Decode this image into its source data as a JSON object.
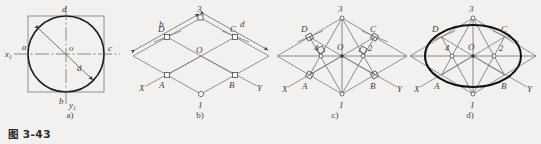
{
  "figure": {
    "caption": "图 3-43",
    "panels": [
      {
        "id": "a",
        "sub_label": "a)",
        "description": "circle inscribed in square with axes x1 y1 and diameter d",
        "labels": {
          "axis_x": "x",
          "axis_x_sub": "1",
          "axis_y": "y",
          "axis_y_sub": "1",
          "point_left": "a",
          "point_right": "c",
          "point_top": "d",
          "point_bottom": "b",
          "center": "o",
          "diameter": "d"
        }
      },
      {
        "id": "b",
        "sub_label": "b)",
        "description": "isometric rhombus projection of square with axes X Y and dimensions b and d",
        "labels": {
          "vertex_top": "3",
          "vertex_bottom": "1",
          "point_A": "A",
          "point_B": "B",
          "point_C": "C",
          "point_D": "D",
          "center": "O",
          "axis_X": "X",
          "axis_Y": "Y",
          "dim_left": "b",
          "dim_right": "d"
        }
      },
      {
        "id": "c",
        "sub_label": "c)",
        "description": "four-center construction lines with right angle marks and centers 1 2 3 4",
        "labels": {
          "vertex_top": "3",
          "vertex_bottom": "1",
          "point_A": "A",
          "point_B": "B",
          "point_C": "C",
          "point_D": "D",
          "center": "O",
          "center_left": "4",
          "center_right": "2",
          "axis_X": "X",
          "axis_Y": "Y"
        }
      },
      {
        "id": "d",
        "sub_label": "d)",
        "description": "completed four-center approximate ellipse inscribed in the rhombus",
        "labels": {
          "vertex_top": "3",
          "vertex_bottom": "1",
          "point_A": "A",
          "point_B": "B",
          "point_C": "C",
          "point_D": "D",
          "center": "O",
          "center_left": "4",
          "center_right": "2",
          "axis_X": "X",
          "axis_Y": "Y"
        }
      }
    ]
  },
  "colors": {
    "background": "#f2f1ef",
    "thin_line": "#6f6f6f",
    "thick_line": "#1d1d1d",
    "label_text": "#3f3f3f",
    "caption_text": "#2b2b2b"
  }
}
